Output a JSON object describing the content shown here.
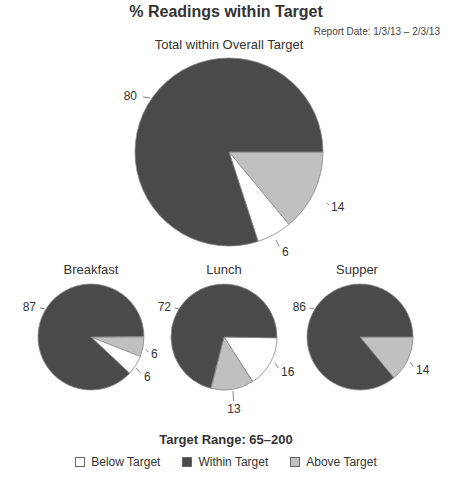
{
  "header": {
    "title": "% Readings within Target",
    "report_date": "Report Date: 1/3/13 – 2/3/13"
  },
  "colors": {
    "below": "#ffffff",
    "within": "#4a4a4a",
    "above": "#c0c0c0",
    "stroke": "#888888"
  },
  "footer": {
    "target_range": "Target Range: 65–200"
  },
  "legend": [
    {
      "key": "below",
      "label": "Below Target"
    },
    {
      "key": "within",
      "label": "Within Target"
    },
    {
      "key": "above",
      "label": "Above Target"
    }
  ],
  "chart_data": [
    {
      "type": "pie",
      "title": "Total within Overall Target",
      "categories": [
        "Below Target",
        "Within Target",
        "Above Target"
      ],
      "values": [
        6,
        80,
        14
      ]
    },
    {
      "type": "pie",
      "title": "Breakfast",
      "categories": [
        "Below Target",
        "Within Target",
        "Above Target"
      ],
      "values": [
        6,
        87,
        6
      ]
    },
    {
      "type": "pie",
      "title": "Lunch",
      "categories": [
        "Below Target",
        "Within Target",
        "Above Target"
      ],
      "values": [
        16,
        72,
        13
      ]
    },
    {
      "type": "pie",
      "title": "Supper",
      "categories": [
        "Below Target",
        "Within Target",
        "Above Target"
      ],
      "values": [
        0,
        86,
        14
      ]
    }
  ],
  "pies": [
    {
      "name": "pie-total",
      "cx": 229,
      "cy": 152,
      "r": 94,
      "title_x": 229,
      "title_y": 49,
      "slices": [
        {
          "key": "above",
          "value": 14,
          "start": 0,
          "label": "14",
          "lx": 327,
          "ly": 203,
          "tx": 331,
          "ty": 207,
          "anchor": "start"
        },
        {
          "key": "below",
          "value": 6,
          "start": 50.4,
          "label": "6",
          "lx": 276,
          "ly": 240,
          "tx": 282,
          "ty": 252,
          "anchor": "start"
        },
        {
          "key": "within",
          "value": 80,
          "start": 72,
          "label": "80",
          "lx": 150,
          "ly": 98,
          "tx": 137,
          "ty": 96,
          "anchor": "end"
        }
      ]
    },
    {
      "name": "pie-breakfast",
      "cx": 91,
      "cy": 337,
      "r": 53,
      "title_x": 91,
      "title_y": 274,
      "slices": [
        {
          "key": "above",
          "value": 6,
          "start": 0,
          "label": "6",
          "lx": 146,
          "ly": 350,
          "tx": 151,
          "ty": 354,
          "anchor": "start"
        },
        {
          "key": "below",
          "value": 6,
          "start": 21.6,
          "label": "6",
          "lx": 136,
          "ly": 368,
          "tx": 144,
          "ty": 377,
          "anchor": "start"
        },
        {
          "key": "within",
          "value": 87,
          "start": 43.2,
          "label": "87",
          "lx": 45,
          "ly": 309,
          "tx": 36,
          "ty": 307,
          "anchor": "end"
        }
      ]
    },
    {
      "name": "pie-lunch",
      "cx": 224,
      "cy": 337,
      "r": 53,
      "title_x": 224,
      "title_y": 274,
      "slices": [
        {
          "key": "below",
          "value": 16,
          "start": 0,
          "label": "16",
          "lx": 275,
          "ly": 363,
          "tx": 281,
          "ty": 372,
          "anchor": "start"
        },
        {
          "key": "above",
          "value": 13,
          "start": 57.6,
          "label": "13",
          "lx": 233,
          "ly": 391,
          "tx": 234,
          "ty": 409,
          "anchor": "middle"
        },
        {
          "key": "within",
          "value": 72,
          "start": 104.4,
          "label": "72",
          "lx": 179,
          "ly": 309,
          "tx": 171,
          "ty": 307,
          "anchor": "end"
        }
      ]
    },
    {
      "name": "pie-supper",
      "cx": 360,
      "cy": 337,
      "r": 53,
      "title_x": 357,
      "title_y": 274,
      "slices": [
        {
          "key": "above",
          "value": 14,
          "start": 0,
          "label": "14",
          "lx": 410,
          "ly": 362,
          "tx": 416,
          "ty": 370,
          "anchor": "start"
        },
        {
          "key": "within",
          "value": 86,
          "start": 50.4,
          "label": "86",
          "lx": 314,
          "ly": 309,
          "tx": 306,
          "ty": 307,
          "anchor": "end"
        }
      ]
    }
  ]
}
